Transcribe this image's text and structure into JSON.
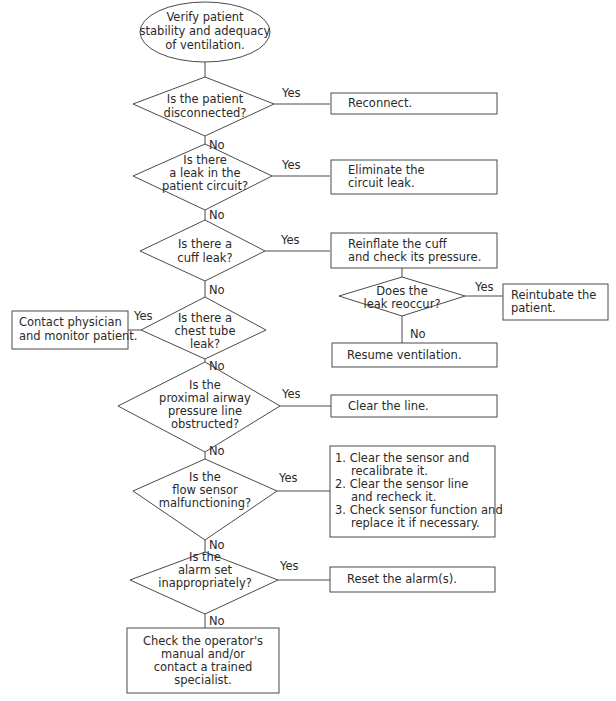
{
  "diagram": {
    "colors": {
      "stroke": "#4a4a4a",
      "text": "#2a2a2a",
      "background": "#ffffff"
    },
    "start": {
      "lines": [
        "Verify patient",
        "stability and adequacy",
        "of ventilation."
      ]
    },
    "edge_labels": {
      "yes": "Yes",
      "no": "No"
    },
    "decisions": [
      {
        "id": "disconnected",
        "lines": [
          "Is the patient",
          "disconnected?"
        ]
      },
      {
        "id": "circuit-leak",
        "lines": [
          "Is there",
          "a leak in the",
          "patient circuit?"
        ]
      },
      {
        "id": "cuff-leak",
        "lines": [
          "Is there a",
          "cuff leak?"
        ]
      },
      {
        "id": "chest-tube-leak",
        "lines": [
          "Is there a",
          "chest tube",
          "leak?"
        ]
      },
      {
        "id": "pressure-line",
        "lines": [
          "Is the",
          "proximal airway",
          "pressure line",
          "obstructed?"
        ]
      },
      {
        "id": "flow-sensor",
        "lines": [
          "Is the",
          "flow sensor",
          "malfunctioning?"
        ]
      },
      {
        "id": "alarm-set",
        "lines": [
          "Is the",
          "alarm set",
          "inappropriately?"
        ]
      },
      {
        "id": "leak-reoccur",
        "lines": [
          "Does the",
          "leak reoccur?"
        ]
      }
    ],
    "actions": [
      {
        "id": "reconnect",
        "lines": [
          "Reconnect."
        ]
      },
      {
        "id": "eliminate-leak",
        "lines": [
          "Eliminate the",
          "circuit leak."
        ]
      },
      {
        "id": "reinflate-cuff",
        "lines": [
          "Reinflate the cuff",
          "and check its pressure."
        ]
      },
      {
        "id": "reintubate",
        "lines": [
          "Reintubate the",
          "patient."
        ]
      },
      {
        "id": "resume-ventilation",
        "lines": [
          "Resume ventilation."
        ]
      },
      {
        "id": "contact-physician",
        "lines": [
          "Contact physician",
          "and monitor patient."
        ]
      },
      {
        "id": "clear-line",
        "lines": [
          "Clear the line."
        ]
      },
      {
        "id": "sensor-steps",
        "lines": [
          "1. Clear the sensor and",
          "recalibrate it.",
          "2. Clear the sensor line",
          "and recheck it.",
          "3. Check sensor function and",
          "replace it if necessary."
        ]
      },
      {
        "id": "reset-alarm",
        "lines": [
          "Reset the alarm(s)."
        ]
      },
      {
        "id": "check-manual",
        "lines": [
          "Check the operator's",
          "manual and/or",
          "contact a trained",
          "specialist."
        ]
      }
    ]
  }
}
